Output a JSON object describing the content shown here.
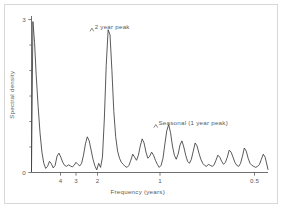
{
  "figure": {
    "background_color": "#ffffff",
    "frame_color": "#d8d8d8",
    "line_color": "#3c3c3c",
    "text_color": "#5a5a5a"
  },
  "chart_data": {
    "type": "line",
    "title": "",
    "subtitle": "",
    "xlabel": "Frequency (years)",
    "ylabel": "Spectral density",
    "grid": false,
    "legend": null,
    "legend_position": "none",
    "x_axis": {
      "label": "Frequency (years)",
      "tick_labels": [
        "4",
        "3",
        "2",
        "1",
        "0.5"
      ],
      "tick_values": [
        4,
        3,
        2,
        1,
        0.5
      ],
      "scale": "period-reciprocal",
      "direction": "decreasing-period-left-to-right",
      "xlim": [
        0,
        1
      ]
    },
    "y_axis": {
      "label": "Spectral density",
      "tick_labels": [
        "0",
        "3"
      ],
      "tick_values": [
        0,
        3
      ],
      "ylim": [
        0,
        3.05
      ],
      "minor_ticks": [
        0.5,
        1.0,
        1.5,
        2.0,
        2.5
      ]
    },
    "annotations": [
      {
        "text": "2 year peak",
        "x": 0.25,
        "y": 2.82,
        "points_to_peak_period_years": 2
      },
      {
        "text": "Seasonal (1 year peak)",
        "x": 0.52,
        "y": 0.93,
        "points_to_peak_period_years": 1
      }
    ],
    "series": [
      {
        "name": "Spectral density",
        "x": [
          0.0,
          0.006,
          0.013,
          0.02,
          0.028,
          0.036,
          0.044,
          0.052,
          0.06,
          0.068,
          0.076,
          0.084,
          0.092,
          0.1,
          0.108,
          0.116,
          0.124,
          0.132,
          0.14,
          0.148,
          0.156,
          0.164,
          0.172,
          0.18,
          0.188,
          0.196,
          0.204,
          0.212,
          0.22,
          0.228,
          0.236,
          0.244,
          0.252,
          0.26,
          0.268,
          0.276,
          0.284,
          0.292,
          0.3,
          0.308,
          0.316,
          0.324,
          0.332,
          0.34,
          0.348,
          0.356,
          0.364,
          0.372,
          0.38,
          0.388,
          0.396,
          0.404,
          0.412,
          0.42,
          0.428,
          0.436,
          0.444,
          0.452,
          0.46,
          0.468,
          0.476,
          0.484,
          0.492,
          0.5,
          0.508,
          0.516,
          0.524,
          0.532,
          0.54,
          0.548,
          0.556,
          0.564,
          0.572,
          0.58,
          0.588,
          0.596,
          0.604,
          0.612,
          0.62,
          0.628,
          0.636,
          0.644,
          0.652,
          0.66,
          0.668,
          0.676,
          0.684,
          0.692,
          0.7,
          0.708,
          0.716,
          0.724,
          0.732,
          0.74,
          0.748,
          0.756,
          0.764,
          0.772,
          0.78,
          0.788,
          0.796,
          0.804,
          0.812,
          0.82,
          0.828,
          0.836,
          0.844,
          0.852,
          0.86,
          0.868,
          0.876,
          0.884,
          0.892,
          0.9,
          0.908,
          0.916,
          0.924,
          0.932,
          0.94,
          0.948,
          0.956,
          0.964,
          0.972,
          0.98,
          0.988,
          1.0
        ],
        "values": [
          0.02,
          2.96,
          2.55,
          1.9,
          1.3,
          0.78,
          0.4,
          0.18,
          0.08,
          0.12,
          0.22,
          0.17,
          0.09,
          0.14,
          0.32,
          0.38,
          0.3,
          0.2,
          0.14,
          0.12,
          0.15,
          0.13,
          0.11,
          0.14,
          0.2,
          0.16,
          0.13,
          0.18,
          0.34,
          0.56,
          0.7,
          0.62,
          0.44,
          0.26,
          0.13,
          0.05,
          0.18,
          0.1,
          0.3,
          1.05,
          2.1,
          2.8,
          2.7,
          2.0,
          1.2,
          0.7,
          0.42,
          0.28,
          0.2,
          0.16,
          0.12,
          0.1,
          0.14,
          0.24,
          0.36,
          0.3,
          0.24,
          0.34,
          0.52,
          0.66,
          0.58,
          0.4,
          0.28,
          0.32,
          0.4,
          0.34,
          0.24,
          0.16,
          0.1,
          0.14,
          0.28,
          0.56,
          0.82,
          0.94,
          0.78,
          0.52,
          0.34,
          0.26,
          0.36,
          0.54,
          0.62,
          0.5,
          0.34,
          0.22,
          0.18,
          0.26,
          0.42,
          0.58,
          0.52,
          0.38,
          0.26,
          0.18,
          0.14,
          0.12,
          0.16,
          0.14,
          0.12,
          0.15,
          0.24,
          0.34,
          0.3,
          0.22,
          0.16,
          0.2,
          0.3,
          0.44,
          0.4,
          0.3,
          0.2,
          0.14,
          0.12,
          0.18,
          0.32,
          0.48,
          0.42,
          0.28,
          0.18,
          0.14,
          0.12,
          0.1,
          0.12,
          0.16,
          0.26,
          0.36,
          0.3,
          0.06
        ]
      }
    ]
  }
}
